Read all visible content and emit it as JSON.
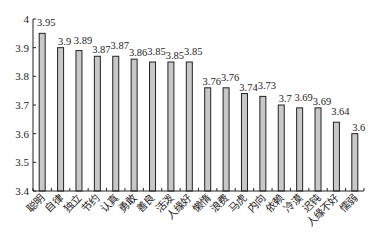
{
  "chart_data": {
    "type": "bar",
    "title": "",
    "xlabel": "",
    "ylabel": "",
    "ylim": [
      3.4,
      4.0
    ],
    "yticks": [
      "3.4",
      "3.5",
      "3.6",
      "3.7",
      "3.8",
      "3.9",
      "4"
    ],
    "grid": false,
    "legend": null,
    "bar_color": "#c8c8c8",
    "bar_edge_color": "#222222",
    "categories": [
      "聪明",
      "自律",
      "独立",
      "节约",
      "认真",
      "勇敢",
      "善良",
      "活泼",
      "人缘好",
      "懒惰",
      "浪费",
      "马虎",
      "内向",
      "依赖",
      "冷漠",
      "迟钝",
      "人缘不好",
      "懦弱"
    ],
    "values": [
      3.95,
      3.9,
      3.89,
      3.87,
      3.87,
      3.86,
      3.85,
      3.85,
      3.85,
      3.76,
      3.76,
      3.74,
      3.73,
      3.7,
      3.69,
      3.69,
      3.64,
      3.6
    ],
    "value_labels": [
      "3.95",
      "3.9",
      "3.89",
      "3.87",
      "3.87",
      "3.86",
      "3.85",
      "3.85",
      "3.85",
      "3.76",
      "3.76",
      "3.74",
      "3.73",
      "3.7",
      "3.69",
      "3.69",
      "3.64",
      "3.6"
    ]
  }
}
